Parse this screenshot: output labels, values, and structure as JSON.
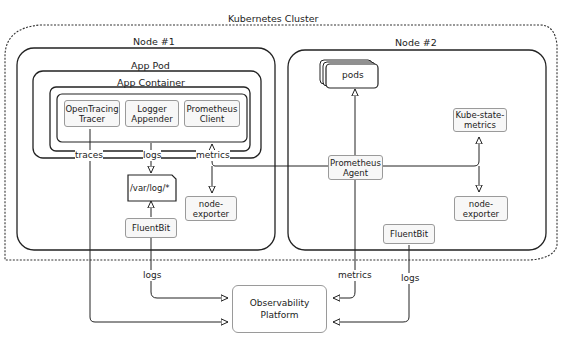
{
  "cluster": {
    "title": "Kubernetes Cluster"
  },
  "node1": {
    "title": "Node #1",
    "pod_title": "App Pod",
    "container_title": "App Container",
    "components": [
      {
        "line1": "OpenTracing",
        "line2": "Tracer"
      },
      {
        "line1": "Logger",
        "line2": "Appender"
      },
      {
        "line1": "Prometheus",
        "line2": "Client"
      }
    ],
    "log_file": "/var/log/*",
    "fluentbit": "FluentBit",
    "node_exporter": {
      "line1": "node-",
      "line2": "exporter"
    },
    "edge_labels": {
      "traces": "traces",
      "logs": "logs",
      "metrics": "metrics"
    }
  },
  "node2": {
    "title": "Node #2",
    "pods": "pods",
    "kube_state_metrics": {
      "line1": "Kube-state-",
      "line2": "metrics"
    },
    "prometheus_agent": {
      "line1": "Prometheus",
      "line2": "Agent"
    },
    "node_exporter": {
      "line1": "node-",
      "line2": "exporter"
    },
    "fluentbit": "FluentBit"
  },
  "observability": {
    "line1": "Observability",
    "line2": "Platform"
  },
  "bottom_labels": {
    "logs_left": "logs",
    "metrics": "metrics",
    "logs_right": "logs"
  }
}
